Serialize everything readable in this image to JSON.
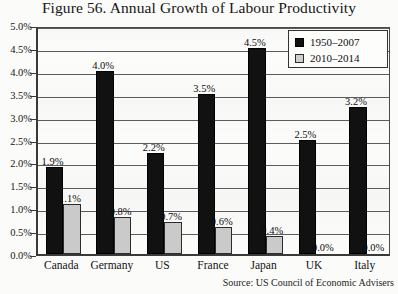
{
  "title": "Figure 56. Annual Growth of Labour Productivity",
  "source": "Source: US Council of Economic Advisers",
  "legend": {
    "items": [
      {
        "label": "1950–2007",
        "color": "#111111",
        "swatch": "dark"
      },
      {
        "label": "2010–2014",
        "color": "#cfcfcf",
        "swatch": "light"
      }
    ]
  },
  "axis": {
    "y_ticks": [
      "0.0%",
      "0.5%",
      "1.0%",
      "1.5%",
      "2.0%",
      "2.5%",
      "3.0%",
      "3.5%",
      "4.0%",
      "4.5%",
      "5.0%"
    ]
  },
  "chart_data": {
    "type": "bar",
    "title": "Figure 56. Annual Growth of Labour Productivity",
    "xlabel": "",
    "ylabel": "",
    "ylim": [
      0,
      5
    ],
    "ytick_step": 0.5,
    "grid": true,
    "legend_position": "top-right",
    "categories": [
      "Canada",
      "Germany",
      "US",
      "France",
      "Japan",
      "UK",
      "Italy"
    ],
    "series": [
      {
        "name": "1950–2007",
        "color": "#111111",
        "values": [
          1.9,
          4.0,
          2.2,
          3.5,
          4.5,
          2.5,
          3.2
        ],
        "labels": [
          "1.9%",
          "4.0%",
          "2.2%",
          "3.5%",
          "4.5%",
          "2.5%",
          "3.2%"
        ]
      },
      {
        "name": "2010–2014",
        "color": "#cfcfcf",
        "values": [
          1.1,
          0.8,
          0.7,
          0.6,
          0.4,
          0.0,
          0.0
        ],
        "labels": [
          "1.1%",
          "0.8%",
          "0.7%",
          "0.6%",
          "0.4%",
          "0.0%",
          "0.0%"
        ]
      }
    ]
  }
}
